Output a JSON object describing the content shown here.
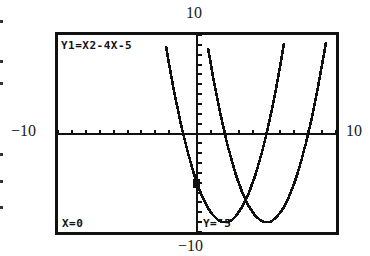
{
  "window": {
    "xmin": -10,
    "xmax": 10,
    "ymin": -10,
    "ymax": 10,
    "labels": {
      "top": "10",
      "bottom": "−10",
      "left": "−10",
      "right": "10"
    }
  },
  "screen": {
    "equation_label": "Y1=X2-4X-5",
    "trace_x": "X=0",
    "trace_y": "Y=¯5"
  },
  "chart_data": {
    "type": "line",
    "title": "",
    "xlabel": "",
    "ylabel": "",
    "xlim": [
      -10,
      10
    ],
    "ylim": [
      -10,
      10
    ],
    "grid": false,
    "axes_ticks": {
      "xscl": 1,
      "yscl": 1
    },
    "series": [
      {
        "name": "Y1",
        "expression": "x^2-4x-5",
        "roots": [
          -1,
          5
        ],
        "vertex": [
          2,
          -9
        ]
      },
      {
        "name": "Y1 shifted right 3",
        "expression": "(x-3)^2-4(x-3)-5",
        "roots": [
          2,
          8
        ],
        "vertex": [
          5,
          -9
        ]
      }
    ],
    "trace_point": {
      "x": 0,
      "y": -5,
      "series": "Y1"
    }
  },
  "colors": {
    "ink": "#111111",
    "background": "#ffffff"
  }
}
